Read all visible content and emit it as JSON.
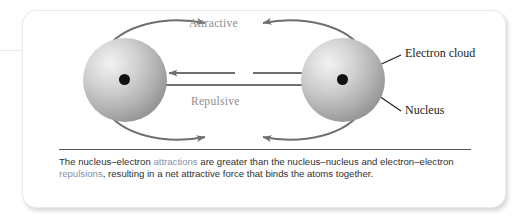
{
  "figure": {
    "diagram_labels": {
      "attractive": "Attractive",
      "repulsive": "Repulsive",
      "electron_cloud": "Electron cloud",
      "nucleus": "Nucleus"
    },
    "caption": {
      "part1": "The nucleus–electron ",
      "highlight1": "attractions",
      "part2": " are greater than the nucleus–nucleus and electron–electron ",
      "highlight2": "repulsions",
      "part3": ", resulting in a net attractive force that binds the atoms together."
    },
    "colors": {
      "highlight": "#7f93ad",
      "arrow": "#6f6f6f",
      "leader_line": "#1b1b1b",
      "nucleus": "#111111",
      "sphere_light": "#f2f2f2",
      "sphere_dark": "#8a8a8a",
      "caption_text": "#303030",
      "panel_background": "#ffffff"
    }
  }
}
